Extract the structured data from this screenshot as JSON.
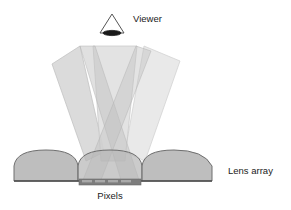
{
  "diagram": {
    "background_color": "#ffffff",
    "labels": {
      "viewer": "Viewer",
      "lens_array": "Lens array",
      "pixels": "Pixels"
    },
    "colors": {
      "beam_left": "#c9c9c9",
      "beam_center": "#d7d7d7",
      "beam_right": "#e2e2e2",
      "beam_stroke": "#b0b0b0",
      "lens_fill": "#b3b3b3",
      "lens_stroke": "#6b6b6b",
      "substrate_line": "#4a4a4a",
      "pixel_bar": "#7d7d7d",
      "pixel_cell": "#a8a8a8",
      "viewer_outline": "#555555",
      "viewer_eye": "#1a1a1a",
      "text": "#222222"
    },
    "viewer": {
      "name": "viewer-icon",
      "apex": [
        112,
        14
      ],
      "base_left": [
        100,
        33
      ],
      "base_right": [
        124,
        33
      ],
      "eye_cx": 112,
      "eye_cy": 33,
      "eye_rx": 9,
      "eye_ry": 2.6
    },
    "beams": [
      {
        "name": "beam-left",
        "points": "55,62 80,47 103,153 88,160",
        "fill": "#c9c9c9",
        "opacity": 0.75
      },
      {
        "name": "beam-center",
        "points": "95,47 137,47 120,160 98,160",
        "fill": "#d7d7d7",
        "opacity": 0.8
      },
      {
        "name": "beam-right",
        "points": "143,47 180,62 141,160 122,153",
        "fill": "#e2e2e2",
        "opacity": 0.75
      },
      {
        "name": "beam-cross-left",
        "points": "80,47 95,47 141,182 123,182",
        "fill": "#c4c4c4",
        "opacity": 0.55
      },
      {
        "name": "beam-cross-right",
        "points": "137,47 152,52 102,182 85,182",
        "fill": "#c4c4c4",
        "opacity": 0.5
      }
    ],
    "lenses": [
      {
        "name": "lens-dome-0",
        "cx": -8,
        "left": -44,
        "right": 28
      },
      {
        "name": "lens-dome-1",
        "cx": 56,
        "left": 20,
        "right": 92
      },
      {
        "name": "lens-dome-2",
        "cx": 113,
        "left": 84,
        "right": 142
      },
      {
        "name": "lens-dome-3",
        "cx": 176,
        "left": 140,
        "right": 212
      },
      {
        "name": "lens-dome-4",
        "cx": 240,
        "left": 204,
        "right": 276
      }
    ],
    "lens_geometry": {
      "baseline_y": 181,
      "dome_top_y": 150,
      "array_left": 14,
      "array_right": 212
    },
    "pixel_bar": {
      "name": "pixel-bar",
      "x": 79,
      "y": 179,
      "width": 62,
      "height": 6,
      "cells": [
        {
          "x": 82,
          "width": 10
        },
        {
          "x": 95,
          "width": 10
        },
        {
          "x": 108,
          "width": 10
        },
        {
          "x": 121,
          "width": 10
        }
      ]
    },
    "label_positions": {
      "viewer": {
        "x": 133,
        "y": 22
      },
      "lens_array": {
        "x": 228,
        "y": 174
      },
      "pixels": {
        "x": 95,
        "y": 199
      }
    }
  }
}
